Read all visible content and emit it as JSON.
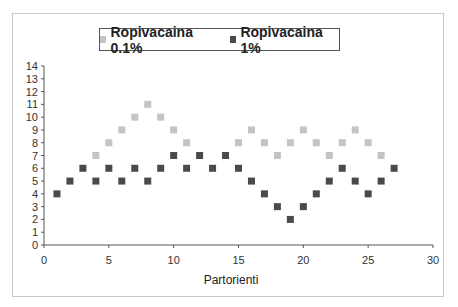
{
  "chart_data": {
    "type": "scatter",
    "title": "",
    "xlabel": "Partorienti",
    "ylabel": "",
    "xlim": [
      0,
      30
    ],
    "ylim": [
      0,
      14
    ],
    "x_ticks": [
      0,
      5,
      10,
      15,
      20,
      25,
      30
    ],
    "y_ticks": [
      0,
      1,
      2,
      3,
      4,
      5,
      6,
      7,
      8,
      9,
      10,
      11,
      12,
      13,
      14
    ],
    "grid": false,
    "legend_position": "top",
    "series": [
      {
        "name": "Ropivacaina 0.1%",
        "color": "#c4c4c4",
        "points": [
          [
            4,
            7
          ],
          [
            5,
            8
          ],
          [
            6,
            9
          ],
          [
            7,
            10
          ],
          [
            8,
            11
          ],
          [
            9,
            10
          ],
          [
            10,
            9
          ],
          [
            11,
            8
          ],
          [
            15,
            8
          ],
          [
            16,
            9
          ],
          [
            17,
            8
          ],
          [
            18,
            7
          ],
          [
            19,
            8
          ],
          [
            20,
            9
          ],
          [
            21,
            8
          ],
          [
            22,
            7
          ],
          [
            23,
            8
          ],
          [
            24,
            9
          ],
          [
            25,
            8
          ],
          [
            26,
            7
          ]
        ]
      },
      {
        "name": "Ropivacaina 1%",
        "color": "#4a4a4a",
        "points": [
          [
            1,
            4
          ],
          [
            2,
            5
          ],
          [
            3,
            6
          ],
          [
            4,
            5
          ],
          [
            5,
            6
          ],
          [
            6,
            5
          ],
          [
            7,
            6
          ],
          [
            8,
            5
          ],
          [
            9,
            6
          ],
          [
            10,
            7
          ],
          [
            11,
            6
          ],
          [
            12,
            7
          ],
          [
            13,
            6
          ],
          [
            14,
            7
          ],
          [
            15,
            6
          ],
          [
            16,
            5
          ],
          [
            17,
            4
          ],
          [
            18,
            3
          ],
          [
            19,
            2
          ],
          [
            20,
            3
          ],
          [
            21,
            4
          ],
          [
            22,
            5
          ],
          [
            23,
            6
          ],
          [
            24,
            5
          ],
          [
            25,
            4
          ],
          [
            26,
            5
          ],
          [
            27,
            6
          ]
        ]
      }
    ]
  },
  "legend": {
    "items": [
      {
        "label": "Ropivacaina 0.1%",
        "color": "#c4c4c4"
      },
      {
        "label": "Ropivacaina 1%",
        "color": "#4a4a4a"
      }
    ]
  }
}
